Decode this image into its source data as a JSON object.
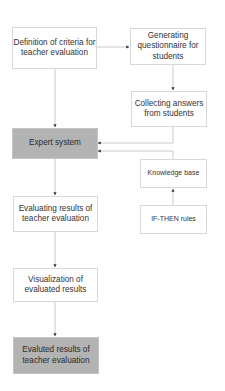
{
  "diagram": {
    "type": "flowchart",
    "nodes": {
      "criteria": {
        "label": "Definition of criteria for teacher evaluation"
      },
      "questionnaire": {
        "label": "Generating questionnaire for students"
      },
      "answers": {
        "label": "Collecting answers from students"
      },
      "expert": {
        "label": "Expert system",
        "fill": "#b3b3b3"
      },
      "knowledge": {
        "label": "Knowledge base"
      },
      "rules": {
        "label": "IF-THEN rules"
      },
      "evaluating": {
        "label": "Evaluating results of teacher evaluation"
      },
      "visualization": {
        "label": "Visualization of evaluated results"
      },
      "final": {
        "label": "Evaluted results of teacher evaluation",
        "fill": "#b3b3b3"
      }
    },
    "edges": [
      {
        "from": "criteria",
        "to": "questionnaire"
      },
      {
        "from": "criteria",
        "to": "expert"
      },
      {
        "from": "questionnaire",
        "to": "answers"
      },
      {
        "from": "answers",
        "to": "expert"
      },
      {
        "from": "knowledge",
        "to": "expert"
      },
      {
        "from": "rules",
        "to": "knowledge"
      },
      {
        "from": "expert",
        "to": "evaluating"
      },
      {
        "from": "evaluating",
        "to": "visualization"
      },
      {
        "from": "visualization",
        "to": "final"
      }
    ]
  }
}
